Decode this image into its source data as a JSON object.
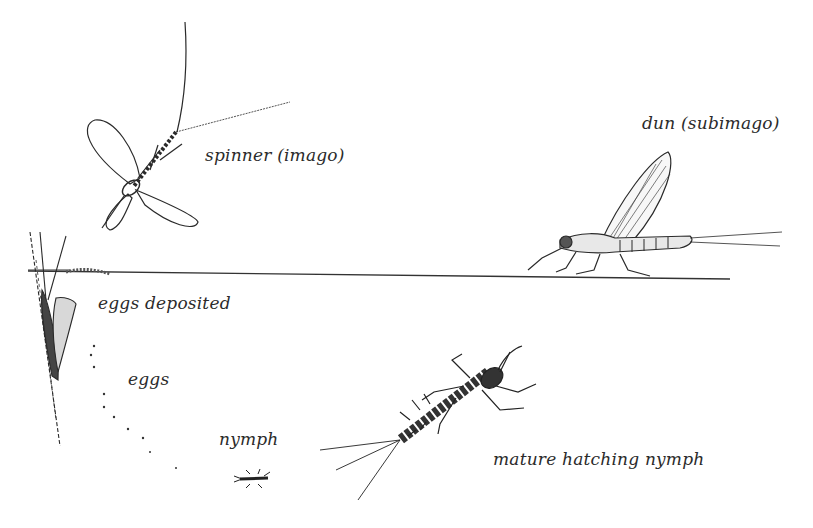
{
  "diagram": {
    "water_line": {
      "y": 272,
      "x_start": 28,
      "x_end": 730
    },
    "stages": [
      {
        "id": "spinner",
        "label": "spinner (imago)",
        "label_pos": [
          205,
          162
        ]
      },
      {
        "id": "dun",
        "label": "dun (subimago)",
        "label_pos": [
          642,
          130
        ]
      },
      {
        "id": "eggs-deposited",
        "label": "eggs deposited",
        "label_pos": [
          98,
          310
        ]
      },
      {
        "id": "eggs",
        "label": "eggs",
        "label_pos": [
          128,
          386
        ]
      },
      {
        "id": "nymph",
        "label": "nymph",
        "label_pos": [
          219,
          446
        ]
      },
      {
        "id": "mature-nymph",
        "label": "mature hatching nymph",
        "label_pos": [
          493,
          466
        ]
      }
    ]
  },
  "colors": {
    "ink": "#2b2b2b",
    "background": "#ffffff"
  }
}
